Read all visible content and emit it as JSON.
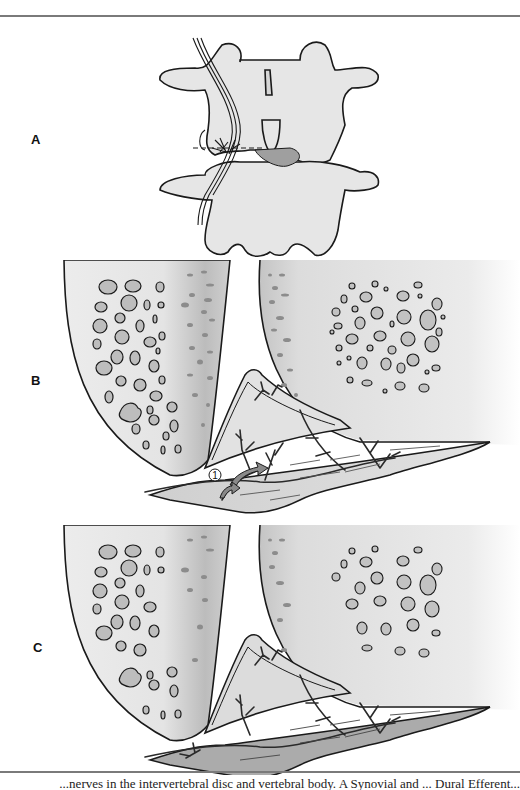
{
  "figure": {
    "panels": [
      {
        "id": "A",
        "label": "A",
        "subject": "lumbar vertebrae posterior view with nerve and dashed section line"
      },
      {
        "id": "B",
        "label": "B",
        "subject": "cross-section of vertebral endplates and disc with vessels, arrow marker 1"
      },
      {
        "id": "C",
        "label": "C",
        "subject": "cross-section of vertebral endplates and disc with vessels, shaded disc"
      }
    ],
    "marker_1": "1",
    "colors": {
      "line": "#1a1a1a",
      "bone_fill": "#e6e6e6",
      "bone_dark": "#bdbdbd",
      "pore_fill": "#b8b8b8",
      "disc_fill": "#d4d4d4",
      "disc_dark_fill": "#a9a9a9",
      "rule": "#7a7a7a"
    }
  },
  "caption": {
    "text": "...nerves in the intervertebral disc and vertebral body. A Synovial and ... Dural Efferent..."
  }
}
